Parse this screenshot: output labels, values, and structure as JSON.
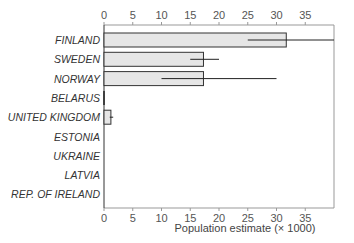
{
  "chart_data": {
    "type": "bar",
    "orientation": "horizontal",
    "title": "",
    "xlabel": "Population estimate (× 1000)",
    "ylabel": "",
    "xlim": [
      0,
      40
    ],
    "x_ticks": [
      0,
      5,
      10,
      15,
      20,
      25,
      30,
      35
    ],
    "x_tick_labels": [
      "0",
      "5",
      "10",
      "15",
      "20",
      "25",
      "30",
      "35"
    ],
    "axis_labels_top_and_bottom": true,
    "grid": false,
    "legend": null,
    "categories": [
      "FINLAND",
      "SWEDEN",
      "NORWAY",
      "BELARUS",
      "UNITED KINGDOM",
      "ESTONIA",
      "UKRAINE",
      "LATVIA",
      "REP. OF IRELAND"
    ],
    "values": [
      31.7,
      17.3,
      17.3,
      0.05,
      1.2,
      0,
      0,
      0,
      0
    ],
    "error_low": [
      25,
      15,
      10,
      null,
      1.0,
      null,
      null,
      null,
      null
    ],
    "error_high": [
      40,
      20,
      30,
      null,
      1.6,
      null,
      null,
      null,
      null
    ],
    "bar_color": "#e6e6e6",
    "bar_edge_color": "#333333"
  }
}
